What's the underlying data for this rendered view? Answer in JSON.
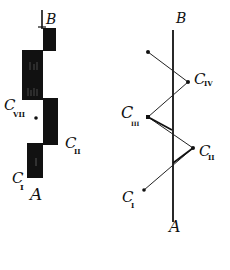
{
  "colors": {
    "ink": "#111111",
    "background": "#ffffff"
  },
  "left_diagram": {
    "top_label": "B",
    "bottom_label": "A",
    "blocks": [
      {
        "name": "top-block",
        "x": 43,
        "y": 28,
        "w": 13,
        "h": 23
      },
      {
        "name": "large-block",
        "x": 22,
        "y": 50,
        "w": 21,
        "h": 50
      },
      {
        "name": "middle-block",
        "x": 43,
        "y": 98,
        "w": 15,
        "h": 47
      },
      {
        "name": "bottom-block",
        "x": 27,
        "y": 143,
        "w": 16,
        "h": 35
      }
    ],
    "labels": [
      {
        "base": "C",
        "sub": "VII"
      },
      {
        "base": "C",
        "sub": "II"
      },
      {
        "base": "C",
        "sub": "I"
      }
    ]
  },
  "right_diagram": {
    "top_label": "B",
    "bottom_label": "A",
    "points": [
      {
        "name": "start",
        "x": 148,
        "y": 52
      },
      {
        "name": "C_IV",
        "x": 188,
        "y": 82
      },
      {
        "name": "C_III",
        "x": 148,
        "y": 117
      },
      {
        "name": "C_II",
        "x": 193,
        "y": 148
      },
      {
        "name": "C_I",
        "x": 144,
        "y": 190
      }
    ],
    "labels": [
      {
        "base": "C",
        "sub": "IV"
      },
      {
        "base": "C",
        "sub": "III"
      },
      {
        "base": "C",
        "sub": "II"
      },
      {
        "base": "C",
        "sub": "I"
      }
    ]
  }
}
